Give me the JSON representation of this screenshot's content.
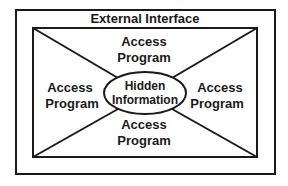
{
  "diagram": {
    "outer_label": "External Interface",
    "center_label": [
      "Hidden",
      "Information"
    ],
    "regions": {
      "top": [
        "Access",
        "Program"
      ],
      "left": [
        "Access",
        "Program"
      ],
      "right": [
        "Access",
        "Program"
      ],
      "bottom": [
        "Access",
        "Program"
      ]
    },
    "colors": {
      "stroke": "#1a1a1a",
      "background": "#ffffff"
    }
  }
}
